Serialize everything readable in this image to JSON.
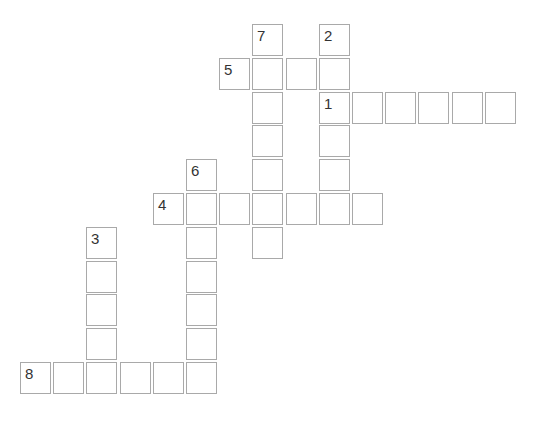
{
  "puzzle": {
    "grid": {
      "origin_x": 20,
      "origin_y": 24,
      "col_pitch": 33.2,
      "row_pitch": 33.8
    },
    "words": [
      {
        "number": "1",
        "direction": "across",
        "col": 9,
        "row": 2,
        "length": 6
      },
      {
        "number": "2",
        "direction": "down",
        "col": 9,
        "row": 0,
        "length": 5
      },
      {
        "number": "3",
        "direction": "down",
        "col": 2,
        "row": 6,
        "length": 5
      },
      {
        "number": "4",
        "direction": "across",
        "col": 4,
        "row": 5,
        "length": 7
      },
      {
        "number": "5",
        "direction": "across",
        "col": 6,
        "row": 1,
        "length": 4
      },
      {
        "number": "6",
        "direction": "down",
        "col": 5,
        "row": 4,
        "length": 7
      },
      {
        "number": "7",
        "direction": "down",
        "col": 7,
        "row": 0,
        "length": 7
      },
      {
        "number": "8",
        "direction": "across",
        "col": 0,
        "row": 10,
        "length": 6
      }
    ],
    "colors": {
      "cell_border": "#a9a9a9",
      "cell_background": "#ffffff",
      "number_text": "#333333"
    }
  }
}
